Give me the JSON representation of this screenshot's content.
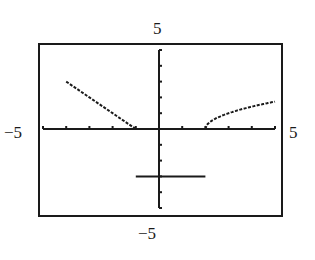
{
  "chart_data": {
    "type": "line",
    "title": "",
    "xlabel": "",
    "ylabel": "",
    "xlim": [
      -5,
      5
    ],
    "ylim": [
      -5,
      5
    ],
    "xscale_tick": 1,
    "yscale_tick": 1,
    "grid": false,
    "window_labels": {
      "ymax": "5",
      "ymin": "−5",
      "xmin": "−5",
      "xmax": "5"
    },
    "series": [
      {
        "name": "piece-1",
        "formula": "y = -x - 1, x ≤ -1",
        "x": [
          -4,
          -3,
          -2,
          -1
        ],
        "y": [
          3,
          2,
          1,
          0
        ]
      },
      {
        "name": "piece-2",
        "formula": "y = -3, -1 < x ≤ 2",
        "x": [
          -1,
          2
        ],
        "y": [
          -3,
          -3
        ]
      },
      {
        "name": "piece-3",
        "formula": "y = √(x − 2), x > 2",
        "x": [
          2,
          2.25,
          3,
          4,
          5
        ],
        "y": [
          0,
          0.5,
          1,
          1.41,
          1.73
        ]
      }
    ],
    "colors": {
      "ink": "#1a1a1a",
      "background": "#ffffff"
    }
  }
}
